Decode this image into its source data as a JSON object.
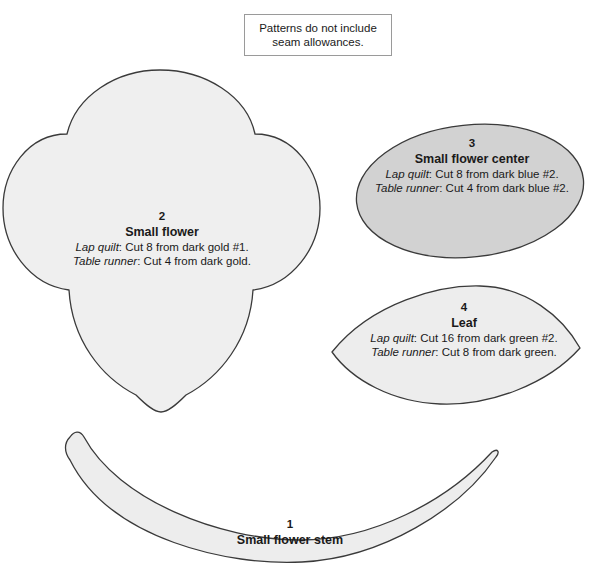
{
  "note": {
    "text": "Patterns do not include seam allowances."
  },
  "colors": {
    "outline": "#3a3a3a",
    "flower_fill": "#efefef",
    "center_fill": "#d2d2d2",
    "leaf_fill": "#ededed",
    "stem_fill": "#ededed",
    "note_border": "#9a9a9a",
    "page_background": "#ffffff"
  },
  "pieces": [
    {
      "id": "small-flower",
      "number": "2",
      "name": "Small flower",
      "lap_quilt_prefix": "Lap quilt",
      "lap_quilt_text": ": Cut 8 from dark gold #1.",
      "table_runner_prefix": "Table runner",
      "table_runner_text": ": Cut 4 from dark gold."
    },
    {
      "id": "small-flower-center",
      "number": "3",
      "name": "Small flower center",
      "lap_quilt_prefix": "Lap quilt",
      "lap_quilt_text": ": Cut 8 from dark blue #2.",
      "table_runner_prefix": "Table runner",
      "table_runner_text": ": Cut 4 from dark blue #2."
    },
    {
      "id": "leaf",
      "number": "4",
      "name": "Leaf",
      "lap_quilt_prefix": "Lap quilt",
      "lap_quilt_text": ": Cut 16 from dark green #2.",
      "table_runner_prefix": "Table runner",
      "table_runner_text": ": Cut 8 from dark green."
    },
    {
      "id": "small-flower-stem",
      "number": "1",
      "name": "Small flower stem",
      "lap_quilt_prefix": "",
      "lap_quilt_text": "",
      "table_runner_prefix": "",
      "table_runner_text": ""
    }
  ]
}
